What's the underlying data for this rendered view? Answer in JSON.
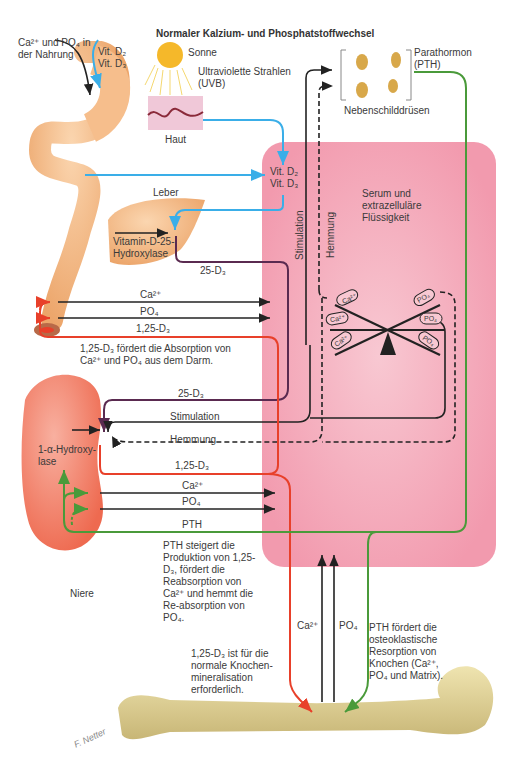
{
  "title": "Normaler Kalzium- und Phosphatstoffwechsel",
  "colors": {
    "serum_box": "#f4a9bb",
    "vitamin_d_arrow": "#3aaee8",
    "d125_arrow": "#e8402a",
    "d25_arrow": "#5a2a50",
    "pth_arrow": "#4a9a3a",
    "black_arrow": "#222222",
    "organ_orange": "#f0a060",
    "kidney": "#f07a60",
    "bone": "#e0d29a"
  },
  "labels": {
    "nahrung": "Ca²⁺ und PO₄ in der Nahrung",
    "vit_d2_top": "Vit. D₂",
    "vit_d3_top": "Vit. D₃",
    "sonne": "Sonne",
    "uv": "Ultraviolette Strahlen (UVB)",
    "haut": "Haut",
    "parathormon": "Parathormon (PTH)",
    "nebenschilddruesen": "Nebenschilddrüsen",
    "vit_d2_serum": "Vit. D₂",
    "vit_d3_serum": "Vit. D₃",
    "leber": "Leber",
    "hydroxylase_25": "Vitamin-D-25-Hydroxylase",
    "d25_liver": "25-D₃",
    "stimulation_vert": "Stimulation",
    "hemmung_vert": "Hemmung",
    "serum": "Serum und extrazelluläre Flüssigkeit",
    "gut_ca": "Ca²⁺",
    "gut_po4": "PO₄",
    "gut_d125": "1,25-D₃",
    "gut_note": "1,25-D₃ fördert die Absorption von Ca²⁺ und PO₄ aus dem Darm.",
    "kidney_d25": "25-D₃",
    "kidney_stim": "Stimulation",
    "kidney_hemm": "Hemmung",
    "hydroxylase_1a": "1-α-Hydroxy-lase",
    "kidney_d125": "1,25-D₃",
    "kidney_ca": "Ca²⁺",
    "kidney_po4": "PO₄",
    "kidney_pth": "PTH",
    "kidney_note": "PTH steigert die Produktion von 1,25-D₃, fördert die Reabsorption von Ca²⁺ und hemmt die Re-absorption von PO₄.",
    "niere": "Niere",
    "bone_ca": "Ca²⁺",
    "bone_po4": "PO₄",
    "bone_note_left": "1,25-D₃ ist für die normale Knochen-mineralisation erforderlich.",
    "bone_note_right": "PTH fördert die osteoklastische Resorption von Knochen (Ca²⁺, PO₄ und Matrix).",
    "balance_left": [
      "Ca²⁺",
      "Ca²⁺",
      "Ca²⁺"
    ],
    "balance_right": [
      "PO₄",
      "PO₄",
      "PO₄"
    ],
    "signature": "F. Netter"
  }
}
